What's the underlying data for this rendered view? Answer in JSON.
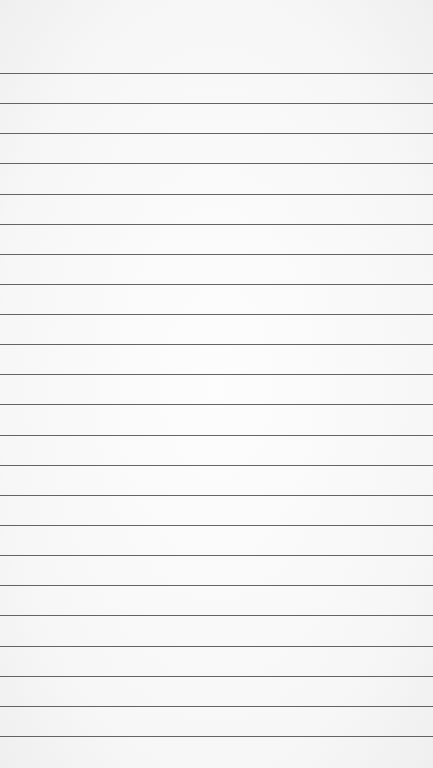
{
  "paper": {
    "background_color": "#fafafa",
    "line_color": "#4a4a4a",
    "line_count": 23,
    "first_line_y": 73,
    "line_spacing": 30.14,
    "lines": [
      73,
      103,
      133,
      163,
      194,
      224,
      254,
      284,
      314,
      344,
      374,
      404,
      435,
      465,
      495,
      525,
      555,
      585,
      615,
      646,
      676,
      706,
      736
    ]
  }
}
